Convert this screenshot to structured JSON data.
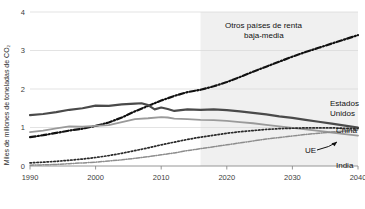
{
  "chart_data": {
    "type": "line",
    "title": "",
    "subtitle": "",
    "xlabel": "",
    "ylabel": "Miles de millones de toneladas de CO₂",
    "xlim": [
      1990,
      2040
    ],
    "ylim": [
      0,
      4
    ],
    "yticks": [
      0,
      1,
      2,
      3,
      4
    ],
    "ytick_labels": [
      "0",
      "1",
      "2",
      "3",
      "4"
    ],
    "xticks": [
      1990,
      2000,
      2010,
      2020,
      2030,
      2040
    ],
    "xtick_labels": [
      "1990",
      "2000",
      "2010",
      "2020",
      "2030",
      "2040"
    ],
    "grid": "horizontal",
    "legend_position": "inline-labels",
    "forecast_start": 2016,
    "forecast_shading_color": "#f0f0f0",
    "annotations": [
      {
        "name": "ue-arrow",
        "text": "",
        "points_to": "UE"
      }
    ],
    "series": [
      {
        "name": "Otros países de renta baja-media",
        "label": "Otros países de renta\nbaja-media",
        "label_line1": "Otros países de renta",
        "label_line2": "baja-media",
        "style": "dash-dot",
        "color": "#111111",
        "width": 2.2,
        "x": [
          1990,
          1992,
          1994,
          1996,
          1998,
          2000,
          2002,
          2004,
          2006,
          2008,
          2010,
          2012,
          2014,
          2016,
          2018,
          2020,
          2022,
          2024,
          2026,
          2028,
          2030,
          2032,
          2034,
          2036,
          2038,
          2040
        ],
        "values": [
          0.75,
          0.8,
          0.86,
          0.92,
          0.97,
          1.04,
          1.13,
          1.26,
          1.42,
          1.56,
          1.7,
          1.82,
          1.92,
          1.98,
          2.07,
          2.18,
          2.31,
          2.45,
          2.58,
          2.71,
          2.84,
          2.96,
          3.07,
          3.18,
          3.29,
          3.4
        ]
      },
      {
        "name": "Estados Unidos",
        "label": "Estados\nUnidos",
        "label_line1": "Estados",
        "label_line2": "Unidos",
        "style": "solid",
        "color": "#4a4a4a",
        "width": 2.2,
        "x": [
          1990,
          1992,
          1994,
          1996,
          1998,
          2000,
          2002,
          2004,
          2006,
          2007,
          2008,
          2009,
          2010,
          2011,
          2012,
          2014,
          2016,
          2018,
          2020,
          2022,
          2024,
          2026,
          2028,
          2030,
          2032,
          2034,
          2036,
          2038,
          2040
        ],
        "values": [
          1.32,
          1.35,
          1.4,
          1.46,
          1.5,
          1.57,
          1.56,
          1.6,
          1.62,
          1.63,
          1.58,
          1.47,
          1.52,
          1.48,
          1.43,
          1.47,
          1.46,
          1.47,
          1.45,
          1.42,
          1.38,
          1.34,
          1.29,
          1.25,
          1.2,
          1.15,
          1.1,
          1.05,
          1.0
        ]
      },
      {
        "name": "China",
        "label": "China",
        "style": "solid",
        "color": "#9a9a9a",
        "width": 1.8,
        "x": [
          1990,
          1992,
          1994,
          1996,
          1998,
          2000,
          2002,
          2004,
          2006,
          2008,
          2010,
          2011,
          2012,
          2014,
          2016,
          2018,
          2020,
          2022,
          2024,
          2026,
          2028,
          2030,
          2032,
          2034,
          2036,
          2038,
          2040
        ],
        "values": [
          0.88,
          0.92,
          0.98,
          1.03,
          1.02,
          1.04,
          1.06,
          1.14,
          1.22,
          1.24,
          1.27,
          1.26,
          1.23,
          1.22,
          1.2,
          1.19,
          1.17,
          1.14,
          1.11,
          1.07,
          1.03,
          0.99,
          0.95,
          0.91,
          0.87,
          0.83,
          0.79
        ]
      },
      {
        "name": "UE",
        "label": "UE",
        "style": "dotted",
        "color": "#2a2a2a",
        "width": 1.7,
        "x": [
          1990,
          1992,
          1994,
          1996,
          1998,
          2000,
          2002,
          2004,
          2006,
          2008,
          2010,
          2012,
          2014,
          2016,
          2018,
          2020,
          2022,
          2024,
          2026,
          2028,
          2030,
          2032,
          2034,
          2036,
          2038,
          2040
        ],
        "values": [
          0.08,
          0.1,
          0.12,
          0.15,
          0.18,
          0.22,
          0.27,
          0.33,
          0.4,
          0.47,
          0.55,
          0.62,
          0.69,
          0.75,
          0.8,
          0.85,
          0.89,
          0.92,
          0.95,
          0.97,
          0.98,
          0.99,
          0.99,
          0.99,
          0.98,
          0.97
        ]
      },
      {
        "name": "India",
        "label": "India",
        "style": "dash-dot",
        "color": "#8d8d8d",
        "width": 1.5,
        "x": [
          1990,
          1992,
          1994,
          1996,
          1998,
          2000,
          2002,
          2004,
          2006,
          2008,
          2010,
          2012,
          2014,
          2016,
          2018,
          2020,
          2022,
          2024,
          2026,
          2028,
          2030,
          2032,
          2034,
          2036,
          2038,
          2040
        ],
        "values": [
          0.02,
          0.03,
          0.04,
          0.06,
          0.08,
          0.1,
          0.13,
          0.16,
          0.2,
          0.24,
          0.29,
          0.34,
          0.4,
          0.45,
          0.5,
          0.55,
          0.6,
          0.65,
          0.7,
          0.74,
          0.78,
          0.82,
          0.85,
          0.88,
          0.91,
          0.93
        ]
      }
    ]
  }
}
